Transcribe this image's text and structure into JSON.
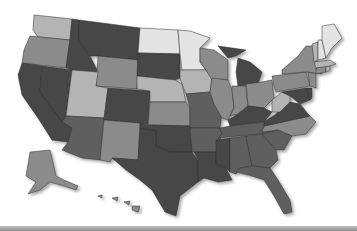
{
  "map": {
    "type": "choropleth",
    "region": "United States",
    "palette": {
      "dark": "#474747",
      "mid_dark": "#5f5f5f",
      "mid": "#8b8b8b",
      "light": "#b4b4b4",
      "very_light": "#e4e4e4"
    },
    "states": [
      {
        "id": "WA",
        "shade": "light",
        "d": "M34,15 L72,19 L70,40 L38,37 L33,30 Z"
      },
      {
        "id": "OR",
        "shade": "mid",
        "d": "M30,36 L70,40 L66,68 L22,63 L24,50 Z"
      },
      {
        "id": "CA",
        "shade": "dark",
        "d": "M22,63 L42,66 L40,92 L72,128 L68,142 L52,140 L38,118 L22,95 L18,75 Z"
      },
      {
        "id": "NV",
        "shade": "dark",
        "d": "M42,66 L72,70 L66,116 L62,122 L40,92 Z"
      },
      {
        "id": "ID",
        "shade": "dark",
        "d": "M72,19 L79,20 L79,40 L90,56 L98,72 L72,70 L66,68 L70,40 Z"
      },
      {
        "id": "MT",
        "shade": "dark",
        "d": "M79,20 L140,28 L138,60 L98,56 L90,56 L79,40 Z"
      },
      {
        "id": "WY",
        "shade": "mid",
        "d": "M98,56 L138,60 L137,89 L96,86 Z"
      },
      {
        "id": "UT",
        "shade": "light",
        "d": "M72,70 L98,72 L96,86 L108,88 L104,118 L66,116 Z"
      },
      {
        "id": "AZ",
        "shade": "mid_dark",
        "d": "M66,116 L104,118 L100,160 L82,158 L62,150 L68,142 L72,128 L62,122 Z"
      },
      {
        "id": "CO",
        "shade": "dark",
        "d": "M108,88 L150,91 L148,124 L104,120 Z"
      },
      {
        "id": "NM",
        "shade": "mid",
        "d": "M104,120 L140,123 L138,160 L112,158 L110,162 L100,160 Z"
      },
      {
        "id": "ND",
        "shade": "very_light",
        "d": "M140,28 L178,30 L180,54 L138,53 Z"
      },
      {
        "id": "SD",
        "shade": "dark",
        "d": "M138,53 L180,54 L180,78 L175,80 L137,76 Z"
      },
      {
        "id": "NE",
        "shade": "light",
        "d": "M137,76 L175,80 L182,84 L186,102 L150,102 L150,91 L137,89 Z"
      },
      {
        "id": "KS",
        "shade": "mid",
        "d": "M150,102 L186,102 L190,108 L190,126 L148,125 Z"
      },
      {
        "id": "OK",
        "shade": "dark",
        "d": "M140,123 L148,125 L190,126 L192,152 L170,152 L156,146 L156,130 L140,129 Z"
      },
      {
        "id": "TX",
        "shade": "dark",
        "d": "M140,129 L156,130 L156,146 L170,152 L192,152 L198,160 L198,182 L180,196 L176,216 L165,212 L152,190 L140,180 L126,170 L112,158 L138,160 Z"
      },
      {
        "id": "MN",
        "shade": "very_light",
        "d": "M178,30 L190,31 L210,38 L200,48 L200,62 L206,70 L182,70 L180,54 Z"
      },
      {
        "id": "IA",
        "shade": "light",
        "d": "M180,70 L206,70 L212,78 L210,92 L186,94 L182,84 L180,78 Z"
      },
      {
        "id": "MO",
        "shade": "mid_dark",
        "d": "M186,94 L210,92 L214,104 L222,114 L220,128 L190,128 L190,108 Z"
      },
      {
        "id": "AR",
        "shade": "mid_dark",
        "d": "M190,128 L220,128 L222,134 L216,152 L194,152 L192,152 Z"
      },
      {
        "id": "LA",
        "shade": "dark",
        "d": "M194,152 L216,152 L216,164 L226,168 L232,180 L218,182 L204,178 L198,182 L198,160 Z"
      },
      {
        "id": "WI",
        "shade": "mid",
        "d": "M200,48 L214,50 L228,60 L228,80 L212,80 L206,70 L200,62 Z"
      },
      {
        "id": "IL",
        "shade": "mid",
        "d": "M212,78 L228,80 L232,90 L234,108 L228,120 L222,118 L214,104 L210,92 Z"
      },
      {
        "id": "MI",
        "shade": "dark",
        "d": "M218,46 L246,50 L236,56 L228,58 Z M238,58 L250,62 L262,72 L258,84 L238,86 L236,72 Z"
      },
      {
        "id": "IN",
        "shade": "mid",
        "d": "M232,86 L246,86 L248,106 L238,114 L230,116 L234,108 L232,90 Z"
      },
      {
        "id": "OH",
        "shade": "mid",
        "d": "M246,84 L262,82 L272,80 L274,98 L264,108 L248,106 Z"
      },
      {
        "id": "KY",
        "shade": "dark",
        "d": "M228,120 L238,114 L248,106 L264,108 L272,112 L264,122 L230,126 Z"
      },
      {
        "id": "TN",
        "shade": "mid_dark",
        "d": "M220,128 L230,126 L264,122 L288,120 L282,132 L218,138 L222,134 Z"
      },
      {
        "id": "MS",
        "shade": "dark",
        "d": "M216,140 L230,138 L230,172 L226,168 L216,164 Z"
      },
      {
        "id": "AL",
        "shade": "mid_dark",
        "d": "M230,138 L246,136 L252,166 L240,168 L236,174 L230,172 Z"
      },
      {
        "id": "GA",
        "shade": "mid_dark",
        "d": "M246,136 L262,134 L276,150 L278,160 L270,168 L252,166 Z"
      },
      {
        "id": "FL",
        "shade": "mid_dark",
        "d": "M236,172 L240,168 L252,166 L270,168 L278,180 L290,200 L292,212 L284,214 L274,196 L264,180 L252,176 Z"
      },
      {
        "id": "SC",
        "shade": "mid_dark",
        "d": "M262,134 L278,130 L292,136 L284,150 L276,150 Z"
      },
      {
        "id": "NC",
        "shade": "mid",
        "d": "M264,126 L310,116 L316,122 L306,134 L292,136 L278,130 L262,132 Z"
      },
      {
        "id": "VA",
        "shade": "dark",
        "d": "M264,122 L276,114 L290,102 L300,104 L308,114 L310,116 L264,126 Z"
      },
      {
        "id": "WV",
        "shade": "light",
        "d": "M272,100 L282,92 L290,96 L290,102 L280,112 L272,112 Z"
      },
      {
        "id": "PA",
        "shade": "mid",
        "d": "M272,76 L306,72 L310,86 L276,92 L274,86 Z"
      },
      {
        "id": "NY",
        "shade": "mid",
        "d": "M282,70 L298,56 L306,46 L314,46 L318,68 L322,74 L306,72 L282,74 Z"
      },
      {
        "id": "MD",
        "shade": "dark",
        "d": "M282,92 L306,88 L310,100 L300,104 L290,96 Z"
      },
      {
        "id": "DE",
        "shade": "dark",
        "d": "M306,88 L312,88 L312,98 L310,100 Z"
      },
      {
        "id": "NJ",
        "shade": "mid",
        "d": "M308,72 L316,74 L316,88 L310,86 Z"
      },
      {
        "id": "CT",
        "shade": "mid",
        "d": "M316,68 L326,66 L326,72 L316,74 Z"
      },
      {
        "id": "RI",
        "shade": "light",
        "d": "M326,66 L330,66 L330,70 L326,72 Z"
      },
      {
        "id": "MA",
        "shade": "light",
        "d": "M314,62 L330,60 L336,64 L330,66 L316,68 Z"
      },
      {
        "id": "VT",
        "shade": "light",
        "d": "M312,44 L318,42 L318,60 L314,62 Z"
      },
      {
        "id": "NH",
        "shade": "very_light",
        "d": "M318,40 L322,40 L326,58 L318,60 Z"
      },
      {
        "id": "ME",
        "shade": "very_light",
        "d": "M322,26 L334,24 L342,38 L332,48 L326,58 L322,40 Z"
      },
      {
        "id": "AK",
        "shade": "mid",
        "d": "M30,152 L50,150 L56,176 L64,180 L78,186 L76,190 L64,186 L50,182 L40,190 L28,194 L36,182 L26,176 L28,164 Z"
      },
      {
        "id": "HI",
        "shade": "mid",
        "d": "M98,196 L102,195 L102,198 Z M112,198 L118,197 L117,201 Z M124,202 L130,201 L129,205 Z M132,206 L140,206 L138,212 L132,210 Z"
      }
    ]
  }
}
